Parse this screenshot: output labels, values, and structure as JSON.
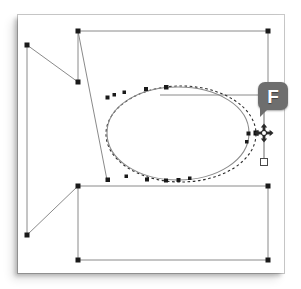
{
  "app": {
    "name": "vector-path-editor",
    "canvas_label": "drawing-canvas"
  },
  "badge": {
    "label": "F",
    "name": "fireworks-tool-badge",
    "color": "#6e6e6e",
    "text_color": "#ffffff"
  },
  "colors": {
    "canvas_background": "#ffffff",
    "page_border": "#c9c9c9",
    "path_stroke": "#808080",
    "node_fill": "#1a1a1a",
    "handle_fill": "#ffffff",
    "handle_stroke": "#555555",
    "dashed_preview": "#2b2b2b"
  },
  "geometry": {
    "canvas": {
      "x": 18,
      "y": 15,
      "width": 266,
      "height": 258
    },
    "top_rail": {
      "x1": 78,
      "y1": 31,
      "x2": 268,
      "y2": 31
    },
    "bottom_rail": {
      "x1": 78,
      "y1": 260,
      "x2": 268,
      "y2": 260
    },
    "mid_rail": {
      "x1": 78,
      "y1": 186,
      "x2": 268,
      "y2": 186
    },
    "upper_mid_rail": {
      "x1": 160,
      "y1": 95,
      "x2": 268,
      "y2": 95
    },
    "left_vertical": {
      "x1": 27,
      "y1": 45,
      "x2": 27,
      "y2": 235
    },
    "right_vertical_top": {
      "x1": 268,
      "y1": 31,
      "x2": 268,
      "y2": 95
    },
    "right_vertical_bottom": {
      "x1": 268,
      "y1": 186,
      "x2": 268,
      "y2": 260
    },
    "stem_vertical": {
      "x1": 78,
      "y1": 31,
      "x2": 78,
      "y2": 82
    },
    "stem_vertical_lower": {
      "x1": 78,
      "y1": 186,
      "x2": 78,
      "y2": 260
    },
    "diagonal_upper": {
      "x1": 27,
      "y1": 45,
      "x2": 78,
      "y2": 82
    },
    "diagonal_long": {
      "x1": 78,
      "y1": 31,
      "x2": 107,
      "y2": 180
    },
    "diagonal_lower": {
      "x1": 27,
      "y1": 235,
      "x2": 78,
      "y2": 186
    },
    "ellipse_solid": {
      "cx": 178,
      "cy": 134,
      "rx": 71,
      "ry": 47
    },
    "ellipse_dashed": {
      "cx": 181,
      "cy": 134,
      "rx": 75,
      "ry": 48
    },
    "handle_line": {
      "x1": 264,
      "y1": 103,
      "x2": 264,
      "y2": 163
    },
    "handle_top": {
      "x": 264,
      "y": 103
    },
    "handle_bottom": {
      "x": 264,
      "y": 163
    },
    "selected_node": {
      "x": 256,
      "y": 133
    },
    "move_cursor": {
      "x": 264,
      "y": 133
    }
  },
  "nodes": {
    "corner_nodes": [
      {
        "name": "node-top-left-rail",
        "x": 78,
        "y": 31
      },
      {
        "name": "node-top-right-rail",
        "x": 268,
        "y": 31
      },
      {
        "name": "node-left-upper",
        "x": 27,
        "y": 45
      },
      {
        "name": "node-stem-upper-end",
        "x": 78,
        "y": 82
      },
      {
        "name": "node-right-upper-mid",
        "x": 268,
        "y": 95
      },
      {
        "name": "node-ellipse-left-lower",
        "x": 107,
        "y": 180
      },
      {
        "name": "node-right-mid-rail",
        "x": 268,
        "y": 186
      },
      {
        "name": "node-stem-lower-start",
        "x": 78,
        "y": 186
      },
      {
        "name": "node-left-lower",
        "x": 27,
        "y": 235
      },
      {
        "name": "node-bottom-left-rail",
        "x": 78,
        "y": 260
      },
      {
        "name": "node-bottom-right-rail",
        "x": 268,
        "y": 260
      }
    ],
    "ellipse_path_nodes": [
      {
        "x": 107,
        "y": 99
      },
      {
        "x": 114,
        "y": 96
      },
      {
        "x": 124,
        "y": 93
      },
      {
        "x": 146,
        "y": 89
      },
      {
        "x": 166,
        "y": 87
      },
      {
        "x": 222,
        "y": 144
      },
      {
        "x": 220,
        "y": 154
      },
      {
        "x": 190,
        "y": 178
      },
      {
        "x": 178,
        "y": 180
      },
      {
        "x": 166,
        "y": 181
      },
      {
        "x": 147,
        "y": 180
      },
      {
        "x": 126,
        "y": 177
      },
      {
        "x": 110,
        "y": 180
      }
    ]
  }
}
